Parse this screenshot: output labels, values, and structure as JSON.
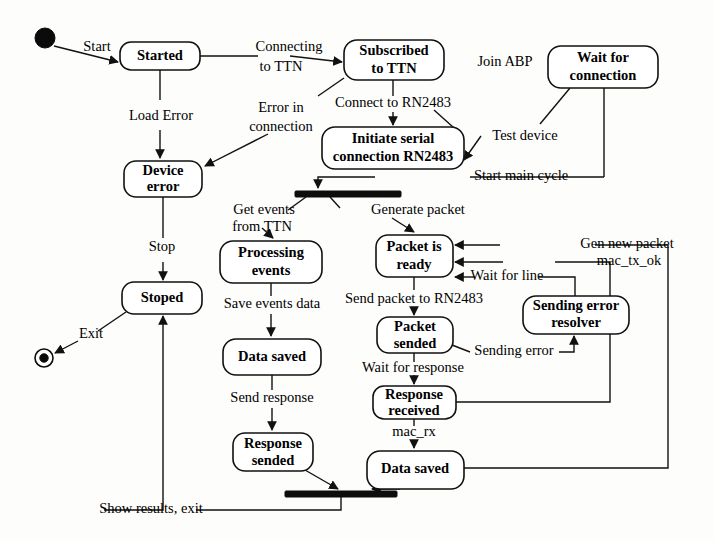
{
  "diagram": {
    "type": "uml-state-diagram",
    "width": 714,
    "height": 539,
    "background_color": "#fdfdfb",
    "line_color": "#111111",
    "text_color": "#000000"
  },
  "nodes": {
    "initial": {
      "name": "initial-node",
      "shape": "filled-circle",
      "x": 45,
      "y": 38,
      "r": 10
    },
    "final": {
      "name": "final-node",
      "shape": "bullseye",
      "x": 44,
      "y": 358,
      "r": 9
    },
    "started": {
      "label": "Started",
      "x": 120,
      "y": 42,
      "w": 80,
      "h": 28
    },
    "subscribed": {
      "label_line1": "Subscribed",
      "label_line2": "to TTN",
      "x": 344,
      "y": 40,
      "w": 100,
      "h": 40
    },
    "wait_connection": {
      "label_line1": "Wait for",
      "label_line2": "connection",
      "x": 548,
      "y": 46,
      "w": 110,
      "h": 42
    },
    "initiate_serial": {
      "label_line1": "Initiate serial",
      "label_line2": "connection RN2483",
      "x": 322,
      "y": 127,
      "w": 142,
      "h": 42
    },
    "device_error": {
      "label_line1": "Device",
      "label_line2": "error",
      "x": 124,
      "y": 161,
      "w": 78,
      "h": 36
    },
    "stoped": {
      "label": "Stoped",
      "x": 122,
      "y": 282,
      "w": 80,
      "h": 32
    },
    "processing_events": {
      "label_line1": "Processing",
      "label_line2": "events",
      "x": 220,
      "y": 241,
      "w": 102,
      "h": 42
    },
    "data_saved_left": {
      "label": "Data saved",
      "x": 223,
      "y": 339,
      "w": 98,
      "h": 36
    },
    "response_sended": {
      "label_line1": "Response",
      "label_line2": "sended",
      "x": 233,
      "y": 433,
      "w": 80,
      "h": 38
    },
    "packet_ready": {
      "label_line1": "Packet is",
      "label_line2": "ready",
      "x": 376,
      "y": 235,
      "w": 77,
      "h": 42
    },
    "packet_sended": {
      "label_line1": "Packet",
      "label_line2": "sended",
      "x": 377,
      "y": 317,
      "w": 76,
      "h": 36
    },
    "sending_error_resolver": {
      "label_line1": "Sending error",
      "label_line2": "resolver",
      "x": 523,
      "y": 296,
      "w": 106,
      "h": 38
    },
    "response_received": {
      "label_line1": "Response",
      "label_line2": "received",
      "x": 373,
      "y": 386,
      "w": 83,
      "h": 33
    },
    "data_saved_right": {
      "label": "Data saved",
      "x": 367,
      "y": 451,
      "w": 97,
      "h": 38
    },
    "fork_bar": {
      "name": "fork-bar",
      "x": 295,
      "y": 191,
      "w": 106,
      "h": 6
    },
    "join_bar": {
      "name": "join-bar",
      "x": 285,
      "y": 491,
      "w": 112,
      "h": 6
    }
  },
  "edges": [
    {
      "id": "start",
      "label": "Start"
    },
    {
      "id": "connecting-to-ttn",
      "label_line1": "Connecting",
      "label_line2": "to TTN"
    },
    {
      "id": "load-error",
      "label": "Load Error"
    },
    {
      "id": "error-in-connection",
      "label_line1": "Error in",
      "label_line2": "connection"
    },
    {
      "id": "connect-to-rn2483",
      "label": "Connect to RN2483"
    },
    {
      "id": "join-abp",
      "label": "Join ABP"
    },
    {
      "id": "test-device",
      "label": "Test device"
    },
    {
      "id": "start-main-cycle",
      "label": "Start main cycle"
    },
    {
      "id": "stop",
      "label": "Stop"
    },
    {
      "id": "exit",
      "label": "Exit"
    },
    {
      "id": "get-events-from-ttn",
      "label_line1": "Get events",
      "label_line2": "from TTN"
    },
    {
      "id": "generate-packet",
      "label": "Generate packet"
    },
    {
      "id": "save-events-data",
      "label": "Save events data"
    },
    {
      "id": "send-response",
      "label": "Send response"
    },
    {
      "id": "gen-new-packet",
      "label": "Gen new packet"
    },
    {
      "id": "mac-tx-ok",
      "label": "mac_tx_ok"
    },
    {
      "id": "wait-for-line",
      "label": "Wait for line"
    },
    {
      "id": "send-packet-to-rn2483",
      "label": "Send packet to RN2483"
    },
    {
      "id": "sending-error",
      "label": "Sending error"
    },
    {
      "id": "wait-for-response",
      "label": "Wait for response"
    },
    {
      "id": "mac-rx",
      "label": "mac_rx"
    },
    {
      "id": "show-results-exit",
      "label": "Show results, exit"
    }
  ],
  "labels": {
    "start": "Start",
    "connecting_to_ttn_1": "Connecting",
    "connecting_to_ttn_2": "to TTN",
    "load_error": "Load Error",
    "error_in_connection_1": "Error in",
    "error_in_connection_2": "connection",
    "connect_to_rn2483": "Connect to RN2483",
    "join_abp": "Join ABP",
    "test_device": "Test device",
    "start_main_cycle": "Start main cycle",
    "stop": "Stop",
    "exit": "Exit",
    "get_events_1": "Get events",
    "get_events_2": "from TTN",
    "generate_packet": "Generate packet",
    "save_events_data": "Save events data",
    "send_response": "Send response",
    "gen_new_packet": "Gen new packet",
    "mac_tx_ok": "mac_tx_ok",
    "wait_for_line": "Wait for line",
    "send_packet_to_rn2483": "Send packet to RN2483",
    "sending_error": "Sending error",
    "wait_for_response": "Wait for response",
    "mac_rx": "mac_rx",
    "show_results_exit": "Show results, exit"
  },
  "states": {
    "started": "Started",
    "subscribed_1": "Subscribed",
    "subscribed_2": "to TTN",
    "wait_conn_1": "Wait for",
    "wait_conn_2": "connection",
    "initiate_1": "Initiate serial",
    "initiate_2": "connection RN2483",
    "device_err_1": "Device",
    "device_err_2": "error",
    "stoped": "Stoped",
    "processing_1": "Processing",
    "processing_2": "events",
    "data_saved_left": "Data saved",
    "response_sended_1": "Response",
    "response_sended_2": "sended",
    "packet_ready_1": "Packet is",
    "packet_ready_2": "ready",
    "packet_sended_1": "Packet",
    "packet_sended_2": "sended",
    "sending_resolver_1": "Sending error",
    "sending_resolver_2": "resolver",
    "response_received_1": "Response",
    "response_received_2": "received",
    "data_saved_right": "Data saved"
  }
}
